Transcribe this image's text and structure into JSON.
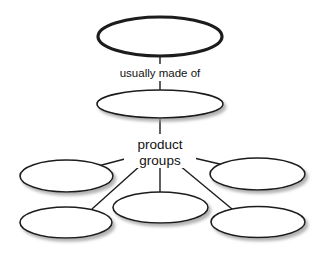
{
  "diagram": {
    "type": "concept-map",
    "background_color": "#ffffff",
    "stroke_color": "#1c1c1c",
    "node_fill_color": "#ffffff",
    "shadow_color": "#b4b4b4",
    "label_color": "#111111",
    "nodes": [
      {
        "id": "root",
        "name": "root-node",
        "label": "",
        "shape": "ellipse",
        "cx": 160,
        "cy": 36.5,
        "rx": 62,
        "ry": 19.5,
        "stroke_width": 3.2,
        "shadow": false
      },
      {
        "id": "level2",
        "name": "level2-node",
        "label": "",
        "shape": "ellipse",
        "cx": 160,
        "cy": 104,
        "rx": 63,
        "ry": 14,
        "stroke_width": 1.6,
        "shadow": true
      },
      {
        "id": "leaf-mid-left",
        "name": "leaf-node-mid-left",
        "label": "",
        "shape": "ellipse",
        "cx": 66.5,
        "cy": 176,
        "rx": 46.5,
        "ry": 16,
        "stroke_width": 1.6,
        "shadow": true
      },
      {
        "id": "leaf-mid-right",
        "name": "leaf-node-mid-right",
        "label": "",
        "shape": "ellipse",
        "cx": 257.5,
        "cy": 174,
        "rx": 47.5,
        "ry": 16,
        "stroke_width": 1.6,
        "shadow": true
      },
      {
        "id": "leaf-bottom-left",
        "name": "leaf-node-bottom-left",
        "label": "",
        "shape": "ellipse",
        "cx": 66,
        "cy": 222.5,
        "rx": 46,
        "ry": 15.5,
        "stroke_width": 1.6,
        "shadow": true
      },
      {
        "id": "leaf-bottom-center",
        "name": "leaf-node-bottom-center",
        "label": "",
        "shape": "ellipse",
        "cx": 160.5,
        "cy": 207.5,
        "rx": 47.5,
        "ry": 15.5,
        "stroke_width": 1.6,
        "shadow": true
      },
      {
        "id": "leaf-bottom-right",
        "name": "leaf-node-bottom-right",
        "label": "",
        "shape": "ellipse",
        "cx": 258,
        "cy": 222,
        "rx": 47,
        "ry": 15.5,
        "stroke_width": 1.6,
        "shadow": true
      }
    ],
    "edges": [
      {
        "id": "edge-root-to-level2",
        "name": "edge-root-to-level2-upper",
        "from": "root",
        "to": "label-usually-made-of",
        "x1": 160,
        "y1": 56,
        "x2": 160,
        "y2": 64,
        "stroke_width": 1.4
      },
      {
        "id": "edge-label-to-level2",
        "name": "edge-label-to-level2-lower",
        "from": "label-usually-made-of",
        "to": "level2",
        "x1": 160,
        "y1": 79,
        "x2": 160,
        "y2": 91,
        "stroke_width": 1.4
      },
      {
        "id": "edge-level2-to-groups",
        "name": "edge-level2-to-product-groups",
        "from": "level2",
        "to": "label-product-groups",
        "x1": 160,
        "y1": 118,
        "x2": 160,
        "y2": 134,
        "stroke_width": 1.4
      },
      {
        "id": "edge-groups-to-mid-left",
        "name": "edge-groups-to-mid-left",
        "from": "label-product-groups",
        "to": "leaf-mid-left",
        "x1": 140,
        "y1": 155,
        "x2": 98,
        "y2": 166,
        "stroke_width": 1.4
      },
      {
        "id": "edge-groups-to-mid-right",
        "name": "edge-groups-to-mid-right",
        "from": "label-product-groups",
        "to": "leaf-mid-right",
        "x1": 181,
        "y1": 155,
        "x2": 224,
        "y2": 165,
        "stroke_width": 1.4
      },
      {
        "id": "edge-groups-to-bottom-left",
        "name": "edge-groups-to-bottom-left",
        "from": "label-product-groups",
        "to": "leaf-bottom-left",
        "x1": 141,
        "y1": 165,
        "x2": 92,
        "y2": 209,
        "stroke_width": 1.4
      },
      {
        "id": "edge-groups-to-bottom-center",
        "name": "edge-groups-to-bottom-center",
        "from": "label-product-groups",
        "to": "leaf-bottom-center",
        "x1": 160,
        "y1": 168,
        "x2": 160,
        "y2": 192,
        "stroke_width": 1.4
      },
      {
        "id": "edge-groups-to-bottom-right",
        "name": "edge-groups-to-bottom-right",
        "from": "label-product-groups",
        "to": "leaf-bottom-right",
        "x1": 179,
        "y1": 165,
        "x2": 232,
        "y2": 209,
        "stroke_width": 1.4
      }
    ],
    "labels": {
      "usually_made_of": {
        "text": "usually made of",
        "x": 160,
        "y": 76,
        "font_size": 11.5
      },
      "product_groups_line1": {
        "text": "product",
        "x": 160,
        "y": 148,
        "font_size": 13.5
      },
      "product_groups_line2": {
        "text": "groups",
        "x": 160,
        "y": 164,
        "font_size": 13.5
      }
    }
  }
}
